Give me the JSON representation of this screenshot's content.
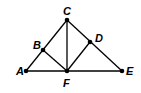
{
  "diagram": {
    "points": {
      "A": {
        "label": "A",
        "x": 26,
        "y": 71,
        "lx": 16,
        "ly": 75
      },
      "B": {
        "label": "B",
        "x": 43,
        "y": 50,
        "lx": 33,
        "ly": 49
      },
      "C": {
        "label": "C",
        "x": 67,
        "y": 20,
        "lx": 63,
        "ly": 15
      },
      "D": {
        "label": "D",
        "x": 90,
        "y": 42,
        "lx": 95,
        "ly": 42
      },
      "E": {
        "label": "E",
        "x": 122,
        "y": 71,
        "lx": 126,
        "ly": 75
      },
      "F": {
        "label": "F",
        "x": 67,
        "y": 71,
        "lx": 63,
        "ly": 87
      }
    },
    "segments": [
      [
        "A",
        "E"
      ],
      [
        "A",
        "C"
      ],
      [
        "C",
        "E"
      ],
      [
        "C",
        "F"
      ],
      [
        "B",
        "F"
      ],
      [
        "D",
        "F"
      ]
    ],
    "stroke_color": "#000000"
  }
}
